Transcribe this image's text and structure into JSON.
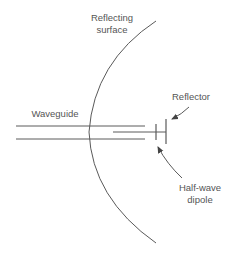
{
  "diagram": {
    "type": "antenna-feed-schematic",
    "labels": {
      "reflecting_surface_line1": "Reflecting",
      "reflecting_surface_line2": "surface",
      "waveguide": "Waveguide",
      "reflector": "Reflector",
      "half_wave_dipole_line1": "Half-wave",
      "half_wave_dipole_line2": "dipole"
    },
    "colors": {
      "line": "#5a5a5a",
      "text": "#555555",
      "background": "#ffffff"
    }
  }
}
